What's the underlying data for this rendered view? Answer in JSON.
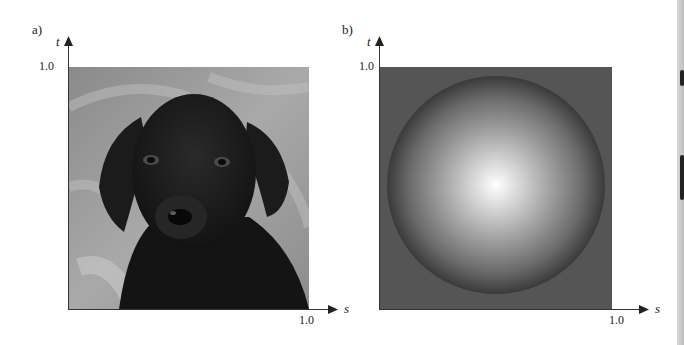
{
  "figure": {
    "panels": [
      {
        "label": "a)",
        "content": "black-labrador-puppy-photo",
        "y_axis_label": "t",
        "x_axis_label": "s",
        "y_tick": "1.0",
        "x_tick": "1.0"
      },
      {
        "label": "b)",
        "content": "shaded-sphere-gradient",
        "y_axis_label": "t",
        "x_axis_label": "s",
        "y_tick": "1.0",
        "x_tick": "1.0"
      }
    ]
  },
  "colors": {
    "axis": "#333333",
    "sphere_background": "#555555",
    "sphere_highlight": "#ffffff",
    "sphere_edge": "#3a3a3a"
  }
}
